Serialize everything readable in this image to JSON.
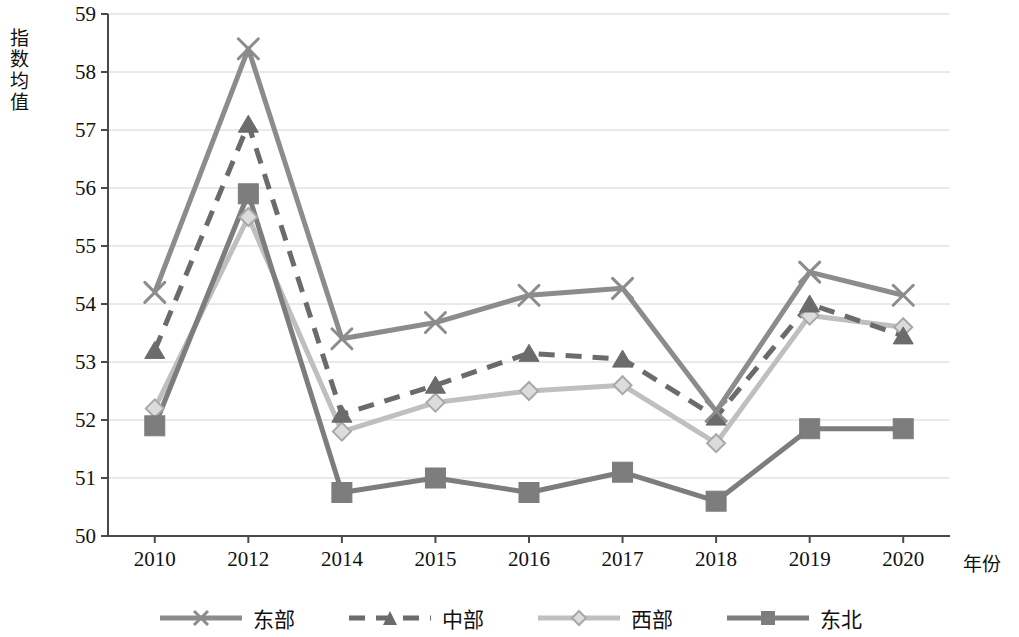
{
  "chart_data": {
    "type": "line",
    "title": "",
    "xlabel": "年份",
    "ylabel": "指数均值",
    "categories": [
      "2010",
      "2012",
      "2014",
      "2015",
      "2016",
      "2017",
      "2018",
      "2019",
      "2020"
    ],
    "ylim": [
      50,
      59
    ],
    "ytick_labels": [
      "59",
      "58",
      "57",
      "56",
      "55",
      "54",
      "53",
      "52",
      "51",
      "50"
    ],
    "ytick_values": [
      59,
      58,
      57,
      56,
      55,
      54,
      53,
      52,
      51,
      50
    ],
    "grid": true,
    "legend_position": "bottom",
    "series": [
      {
        "name": "东部",
        "marker": "x",
        "line_style": "solid",
        "color": "#8c8c8c",
        "values": [
          54.2,
          58.4,
          53.4,
          53.68,
          54.15,
          54.27,
          52.15,
          54.55,
          54.15
        ]
      },
      {
        "name": "中部",
        "marker": "triangle",
        "line_style": "dashed",
        "color": "#6b6b6b",
        "values": [
          53.2,
          57.1,
          52.1,
          52.6,
          53.15,
          53.05,
          52.05,
          54.0,
          53.45
        ]
      },
      {
        "name": "西部",
        "marker": "diamond",
        "line_style": "solid",
        "color": "#bfbfbf",
        "values": [
          52.2,
          55.5,
          51.8,
          52.3,
          52.5,
          52.6,
          51.6,
          53.8,
          53.6
        ]
      },
      {
        "name": "东北",
        "marker": "square",
        "line_style": "solid",
        "color": "#7d7d7d",
        "values": [
          51.9,
          55.9,
          50.75,
          51.0,
          50.75,
          51.1,
          50.6,
          51.85,
          51.85
        ]
      }
    ]
  },
  "axes": {
    "axis_line_color": "#4a4a4a",
    "grid_color": "#d4d4d4"
  },
  "legend": {
    "items": [
      {
        "label": "东部"
      },
      {
        "label": "中部"
      },
      {
        "label": "西部"
      },
      {
        "label": "东北"
      }
    ]
  }
}
